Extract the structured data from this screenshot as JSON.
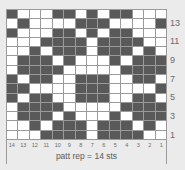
{
  "chart": {
    "columns": 14,
    "rows": 14,
    "colors": {
      "background": "#ebebeb",
      "light": "#ffffff",
      "dark": "#595959",
      "grid": "#9a9a9a"
    },
    "legend_note": "rows listed top (row 14) to bottom (row 1); columns left = st 14 to right = st 1; 1 = dark, 0 = light",
    "grid": [
      [
        1,
        0,
        0,
        0,
        1,
        1,
        0,
        1,
        0,
        1,
        1,
        0,
        0,
        0
      ],
      [
        0,
        1,
        0,
        0,
        0,
        0,
        1,
        1,
        1,
        0,
        0,
        0,
        0,
        1
      ],
      [
        1,
        0,
        0,
        0,
        1,
        1,
        0,
        1,
        0,
        1,
        1,
        0,
        0,
        0
      ],
      [
        0,
        0,
        0,
        1,
        1,
        1,
        1,
        0,
        1,
        1,
        1,
        1,
        0,
        0
      ],
      [
        0,
        0,
        1,
        0,
        1,
        1,
        1,
        0,
        1,
        1,
        1,
        0,
        1,
        0
      ],
      [
        0,
        1,
        1,
        1,
        0,
        1,
        0,
        0,
        0,
        1,
        0,
        1,
        1,
        1
      ],
      [
        0,
        1,
        1,
        1,
        1,
        0,
        0,
        0,
        0,
        0,
        1,
        1,
        1,
        1
      ],
      [
        1,
        0,
        1,
        1,
        0,
        0,
        1,
        1,
        1,
        0,
        0,
        1,
        1,
        0
      ],
      [
        1,
        1,
        0,
        0,
        0,
        0,
        1,
        1,
        1,
        0,
        0,
        0,
        0,
        1
      ],
      [
        1,
        0,
        1,
        1,
        0,
        0,
        1,
        1,
        1,
        0,
        0,
        1,
        1,
        0
      ],
      [
        0,
        1,
        1,
        1,
        1,
        0,
        0,
        0,
        0,
        0,
        1,
        1,
        1,
        1
      ],
      [
        0,
        1,
        1,
        1,
        0,
        1,
        0,
        0,
        0,
        1,
        0,
        1,
        1,
        1
      ],
      [
        0,
        0,
        1,
        0,
        1,
        1,
        1,
        0,
        1,
        1,
        1,
        0,
        1,
        0
      ],
      [
        0,
        0,
        0,
        1,
        1,
        1,
        1,
        0,
        1,
        1,
        1,
        1,
        0,
        0
      ]
    ],
    "row_labels": [
      {
        "label": "13",
        "row_from_top": 1
      },
      {
        "label": "11",
        "row_from_top": 3
      },
      {
        "label": "9",
        "row_from_top": 5
      },
      {
        "label": "7",
        "row_from_top": 7
      },
      {
        "label": "5",
        "row_from_top": 9
      },
      {
        "label": "3",
        "row_from_top": 11
      },
      {
        "label": "1",
        "row_from_top": 13
      }
    ],
    "column_labels": [
      "14",
      "13",
      "12",
      "11",
      "10",
      "9",
      "8",
      "7",
      "6",
      "5",
      "4",
      "3",
      "2",
      "1"
    ],
    "repeat_label": "patt rep = 14 sts"
  }
}
